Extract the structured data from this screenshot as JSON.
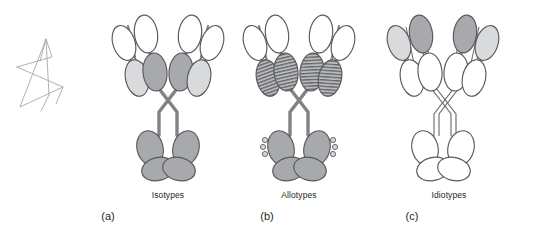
{
  "figure": {
    "name": "antibody-variation-diagram",
    "background_color": "#ffffff",
    "width": 543,
    "height": 232
  },
  "colors": {
    "outline": "#58595b",
    "outline_light": "#6d6e71",
    "dark_gray_fill": "#a7a9ac",
    "light_gray_fill": "#d9dadb",
    "white_fill": "#ffffff",
    "hatch_stroke": "#58595b",
    "text": "#231f20",
    "scribble": "#a6a8ab"
  },
  "panels": [
    {
      "id": "panel-a",
      "title": "Isotypes",
      "caption": "(a)",
      "center_x": 168,
      "title_x": 168,
      "title_y": 198,
      "caption_x": 108,
      "caption_y": 220,
      "variable_region_fill": "white_fill",
      "constant_region_fill": "shaded",
      "fc_fill": "dark_gray_fill",
      "has_hatching": false,
      "has_allotype_markers": false
    },
    {
      "id": "panel-b",
      "title": "Allotypes",
      "caption": "(b)",
      "center_x": 299,
      "title_x": 299,
      "title_y": 198,
      "caption_x": 267,
      "caption_y": 220,
      "variable_region_fill": "white_fill",
      "constant_region_fill": "shaded",
      "fc_fill": "dark_gray_fill",
      "has_hatching": true,
      "has_allotype_markers": true
    },
    {
      "id": "panel-c",
      "title": "Idiotypes",
      "caption": "(c)",
      "center_x": 443,
      "title_x": 449,
      "title_y": 198,
      "caption_x": 412,
      "caption_y": 220,
      "variable_region_fill": "shaded",
      "constant_region_fill": "white_fill",
      "fc_fill": "white_fill",
      "has_hatching": false,
      "has_allotype_markers": false
    }
  ],
  "annotation": {
    "name": "hand-drawn-star-scribble",
    "x": 12,
    "y": 30,
    "width": 62,
    "height": 78,
    "stroke_color": "#a6a8ab"
  },
  "legend_notes": {
    "heavy_chain": "heavy-chain",
    "light_chain": "light-chain",
    "fc_region": "fc-region",
    "hinge": "hinge-region"
  }
}
